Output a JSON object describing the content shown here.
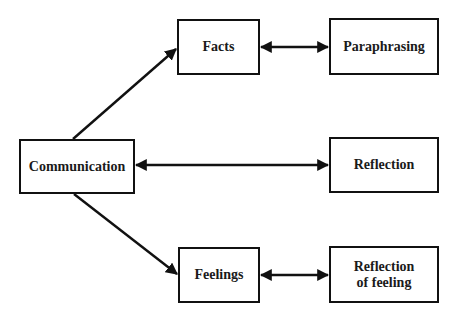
{
  "diagram": {
    "type": "flow",
    "nodes": [
      {
        "id": "communication",
        "label": "Communication",
        "x": 19,
        "y": 139,
        "w": 116,
        "h": 55
      },
      {
        "id": "facts",
        "label": "Facts",
        "x": 177,
        "y": 19,
        "w": 83,
        "h": 56
      },
      {
        "id": "feelings",
        "label": "Feelings",
        "x": 178,
        "y": 247,
        "w": 82,
        "h": 56
      },
      {
        "id": "paraphrasing",
        "label": "Paraphrasing",
        "x": 329,
        "y": 18,
        "w": 110,
        "h": 57
      },
      {
        "id": "reflection",
        "label": "Reflection",
        "x": 329,
        "y": 137,
        "w": 110,
        "h": 56
      },
      {
        "id": "reflection_of_feeling",
        "label": "Reflection\nof feeling",
        "x": 329,
        "y": 246,
        "w": 110,
        "h": 57
      }
    ],
    "edges": [
      {
        "from": "communication",
        "to": "facts",
        "direction": "forward"
      },
      {
        "from": "communication",
        "to": "feelings",
        "direction": "forward"
      },
      {
        "from": "facts",
        "to": "paraphrasing",
        "direction": "both"
      },
      {
        "from": "communication",
        "to": "reflection",
        "direction": "both"
      },
      {
        "from": "feelings",
        "to": "reflection_of_feeling",
        "direction": "both"
      }
    ],
    "colors": {
      "stroke": "#111111",
      "text": "#1a1a1a",
      "background": "#ffffff"
    }
  }
}
